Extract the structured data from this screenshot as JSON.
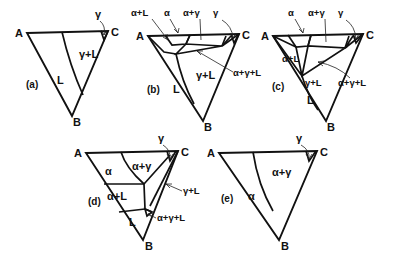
{
  "figure": {
    "background": "#ffffff",
    "ink": "#111111",
    "vertex_labels": {
      "a": "A",
      "b": "B",
      "c": "C"
    },
    "panels": [
      {
        "id": "a",
        "caption": "(a)",
        "vertices": {
          "A": "A",
          "B": "B",
          "C": "C"
        },
        "regions": [
          {
            "name": "liquid",
            "label": "L"
          },
          {
            "name": "gamma-plus-liquid",
            "label": "γ+L"
          }
        ],
        "callouts": [
          {
            "name": "gamma-corner",
            "label": "γ"
          }
        ]
      },
      {
        "id": "b",
        "caption": "(b)",
        "vertices": {
          "A": "A",
          "B": "B",
          "C": "C"
        },
        "regions": [
          {
            "name": "liquid",
            "label": "L"
          },
          {
            "name": "gamma-plus-liquid",
            "label": "γ+L"
          }
        ],
        "callouts": [
          {
            "name": "alpha-plus-liquid",
            "label": "α+L"
          },
          {
            "name": "alpha",
            "label": "α"
          },
          {
            "name": "alpha-plus-gamma",
            "label": "α+γ"
          },
          {
            "name": "gamma-corner",
            "label": "γ"
          },
          {
            "name": "alpha-plus-gamma-plus-liquid",
            "label": "α+γ+L"
          }
        ]
      },
      {
        "id": "c",
        "caption": "(c)",
        "vertices": {
          "A": "A",
          "B": "B",
          "C": "C"
        },
        "regions": [
          {
            "name": "liquid",
            "label": "L"
          },
          {
            "name": "gamma-plus-liquid",
            "label": "γ+L"
          },
          {
            "name": "alpha-plus-liquid",
            "label": "α+L"
          }
        ],
        "callouts": [
          {
            "name": "alpha",
            "label": "α"
          },
          {
            "name": "alpha-plus-gamma",
            "label": "α+γ"
          },
          {
            "name": "gamma-corner",
            "label": "γ"
          },
          {
            "name": "alpha-plus-gamma-plus-liquid",
            "label": "α+γ+L"
          }
        ]
      },
      {
        "id": "d",
        "caption": "(d)",
        "vertices": {
          "A": "A",
          "B": "B",
          "C": "C"
        },
        "regions": [
          {
            "name": "alpha",
            "label": "α"
          },
          {
            "name": "alpha-plus-gamma",
            "label": "α+γ"
          },
          {
            "name": "alpha-plus-liquid",
            "label": "α+L"
          },
          {
            "name": "liquid",
            "label": "L"
          }
        ],
        "callouts": [
          {
            "name": "gamma-corner",
            "label": "γ"
          },
          {
            "name": "gamma-plus-liquid",
            "label": "γ+L"
          },
          {
            "name": "alpha-plus-gamma-plus-liquid",
            "label": "α+γ+L"
          }
        ]
      },
      {
        "id": "e",
        "caption": "(e)",
        "vertices": {
          "A": "A",
          "B": "B",
          "C": "C"
        },
        "regions": [
          {
            "name": "alpha",
            "label": "α"
          },
          {
            "name": "alpha-plus-gamma",
            "label": "α+γ"
          }
        ],
        "callouts": [
          {
            "name": "gamma-corner",
            "label": "γ"
          }
        ]
      }
    ]
  }
}
